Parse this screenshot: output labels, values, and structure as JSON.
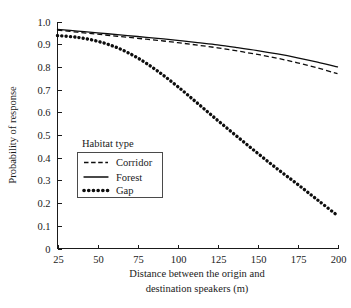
{
  "chart_data": {
    "type": "line",
    "title": "",
    "xlabel": "Distance between the origin and destination speakers (m)",
    "xlabel_line1": "Distance between the origin and",
    "xlabel_line2": "destination speakers (m)",
    "ylabel": "Probability of response",
    "xlim": [
      25,
      200
    ],
    "ylim": [
      0,
      1.0
    ],
    "grid": false,
    "legend_position": "inner-left",
    "legend_title": "Habitat type",
    "xticks": [
      25,
      50,
      75,
      100,
      125,
      150,
      175,
      200
    ],
    "xtick_labels": [
      "25",
      "50",
      "75",
      "100",
      "125",
      "150",
      "175",
      "200"
    ],
    "yticks": [
      0,
      0.1,
      0.2,
      0.3,
      0.4,
      0.5,
      0.6,
      0.7,
      0.8,
      0.9,
      1.0
    ],
    "ytick_labels": [
      "0",
      "0.1",
      "0.2",
      "0.3",
      "0.4",
      "0.5",
      "0.6",
      "0.7",
      "0.8",
      "0.9",
      "1.0"
    ],
    "x": [
      25,
      37.5,
      50,
      62.5,
      75,
      87.5,
      100,
      112.5,
      125,
      137.5,
      150,
      162.5,
      175,
      187.5,
      200
    ],
    "series": [
      {
        "name": "Corridor",
        "style": "dashed",
        "color": "#0d0d0d",
        "values": [
          0.962,
          0.953,
          0.944,
          0.935,
          0.926,
          0.917,
          0.907,
          0.896,
          0.884,
          0.87,
          0.855,
          0.838,
          0.818,
          0.796,
          0.77
        ]
      },
      {
        "name": "Forest",
        "style": "solid",
        "color": "#0d0d0d",
        "values": [
          0.965,
          0.958,
          0.95,
          0.942,
          0.934,
          0.926,
          0.917,
          0.907,
          0.897,
          0.885,
          0.872,
          0.857,
          0.84,
          0.821,
          0.8
        ]
      },
      {
        "name": "Gap",
        "style": "dotted",
        "color": "#0d0d0d",
        "values": [
          0.938,
          0.93,
          0.913,
          0.884,
          0.84,
          0.782,
          0.714,
          0.64,
          0.565,
          0.492,
          0.42,
          0.35,
          0.283,
          0.214,
          0.145
        ]
      }
    ]
  },
  "legend": {
    "title": "Habitat type",
    "entries": [
      {
        "label": "Corridor",
        "style": "dashed"
      },
      {
        "label": "Forest",
        "style": "solid"
      },
      {
        "label": "Gap",
        "style": "dotted"
      }
    ]
  },
  "axes": {
    "y_title": "Probability of response",
    "x_title_line1": "Distance between the origin and",
    "x_title_line2": "destination speakers (m)"
  },
  "colors": {
    "background": "#ffffff",
    "ink": "#1a1a1a",
    "line": "#0d0d0d",
    "legend_border": "#4a4a4a"
  }
}
